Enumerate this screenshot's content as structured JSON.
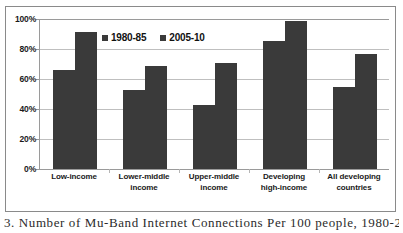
{
  "chart_data": {
    "type": "bar",
    "title": "",
    "xlabel": "",
    "ylabel": "",
    "ylim": [
      0,
      100
    ],
    "ytick_labels": [
      "100%",
      "80%",
      "60%",
      "40%",
      "20%",
      "0%"
    ],
    "ytick_values": [
      100,
      80,
      60,
      40,
      20,
      0
    ],
    "grid": true,
    "legend_position": "top-center",
    "categories": [
      "Low-income",
      "Lower-middle income",
      "Upper-middle income",
      "Developing high-income",
      "All developing countries"
    ],
    "category_lines": [
      [
        "Low-income"
      ],
      [
        "Lower-middle",
        "income"
      ],
      [
        "Upper-middle",
        "income"
      ],
      [
        "Developing",
        "high-income"
      ],
      [
        "All developing",
        "countries"
      ]
    ],
    "series": [
      {
        "name": "1980-85",
        "color": "#3a3a3a",
        "values": [
          66,
          52.5,
          43,
          85.5,
          55
        ]
      },
      {
        "name": "2005-10",
        "color": "#3a3a3a",
        "values": [
          91.5,
          68.5,
          71,
          99,
          77
        ]
      }
    ]
  },
  "legend": {
    "items": [
      {
        "label": "1980-85",
        "swatch": "legend-swatch-1980-85"
      },
      {
        "label": "2005-10",
        "swatch": "legend-swatch-2005-10"
      }
    ]
  },
  "caption": {
    "text": "3. Number of Mu-Band Internet Connections Per 100 people, 1980-2010"
  },
  "colors": {
    "bar": "#3a3a3a",
    "grid": "#bfbfbf",
    "axis": "#9a9a9a",
    "frame": "#8a8a8a",
    "text": "#1a1a1a"
  }
}
